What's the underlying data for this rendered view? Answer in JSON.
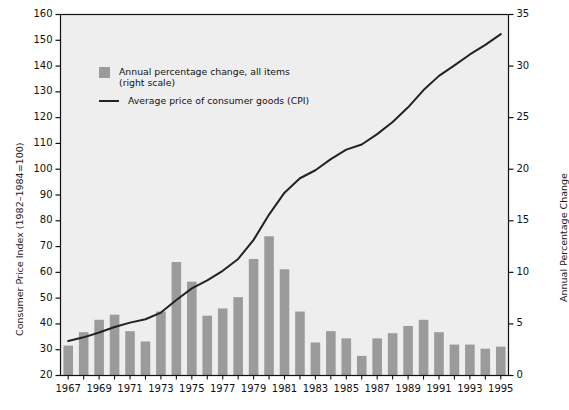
{
  "chart_data": {
    "type": "bar",
    "title": "",
    "subtitle": "",
    "xlabel": "",
    "ylabel": "Consumer Price Index (1982–1984=100)",
    "ylabel_right": "Annual Percentage Change",
    "ylim": [
      20,
      160
    ],
    "ylim_right": [
      0,
      35
    ],
    "ytick_step": 10,
    "ytick_right_step": 5,
    "grid": false,
    "legend_position": "upper-left-inside",
    "yticks": [
      "20",
      "30",
      "40",
      "50",
      "60",
      "70",
      "80",
      "90",
      "100",
      "110",
      "120",
      "130",
      "140",
      "150",
      "160"
    ],
    "yticks_right": [
      "0",
      "5",
      "10",
      "15",
      "20",
      "25",
      "30",
      "35"
    ],
    "x": [
      1967,
      1968,
      1969,
      1970,
      1971,
      1972,
      1973,
      1974,
      1975,
      1976,
      1977,
      1978,
      1979,
      1980,
      1981,
      1982,
      1983,
      1984,
      1985,
      1986,
      1987,
      1988,
      1989,
      1990,
      1991,
      1992,
      1993,
      1994,
      1995
    ],
    "xtick_labels": [
      "1967",
      "1969",
      "1971",
      "1973",
      "1975",
      "1977",
      "1979",
      "1981",
      "1983",
      "1985",
      "1987",
      "1989",
      "1991",
      "1993",
      "1995"
    ],
    "xtick_values": [
      1967,
      1969,
      1971,
      1973,
      1975,
      1977,
      1979,
      1981,
      1983,
      1985,
      1987,
      1989,
      1991,
      1993,
      1995
    ],
    "series": [
      {
        "name": "Annual percentage change, all items (right scale)",
        "type": "bar",
        "axis": "right",
        "color": "#9b9b9b",
        "values": [
          2.9,
          4.2,
          5.4,
          5.9,
          4.3,
          3.3,
          6.2,
          11.0,
          9.1,
          5.8,
          6.5,
          7.6,
          11.3,
          13.5,
          10.3,
          6.2,
          3.2,
          4.3,
          3.6,
          1.9,
          3.6,
          4.1,
          4.8,
          5.4,
          4.2,
          3.0,
          3.0,
          2.6,
          2.8
        ]
      },
      {
        "name": "Average price of consumer goods (CPI)",
        "type": "line",
        "axis": "left",
        "color": "#222222",
        "values": [
          33.4,
          34.8,
          36.7,
          38.8,
          40.5,
          41.8,
          44.4,
          49.3,
          53.8,
          56.9,
          60.6,
          65.2,
          72.6,
          82.4,
          90.9,
          96.5,
          99.6,
          103.9,
          107.6,
          109.6,
          113.6,
          118.3,
          124.0,
          130.7,
          136.2,
          140.3,
          144.5,
          148.2,
          152.4
        ]
      }
    ]
  },
  "legend": {
    "items": [
      {
        "marker": "swatch",
        "label": "Annual percentage change, all items\n(right scale)"
      },
      {
        "marker": "line",
        "label": "Average price of consumer goods (CPI)"
      }
    ]
  },
  "colors": {
    "bar": "#9b9b9b",
    "line": "#222222",
    "plot_background": "#eeeeee",
    "axis": "#111111",
    "page_background": "#ffffff"
  }
}
